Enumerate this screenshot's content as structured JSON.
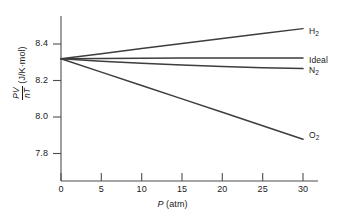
{
  "chart_data": {
    "type": "line",
    "title": "",
    "subtitle": "",
    "xlabel": "P (atm)",
    "xlabel_symbol": "P",
    "xlabel_units": "(atm)",
    "ylabel": "PV/nT (J/K·mol)",
    "ylabel_numerator": "PV",
    "ylabel_denominator": "nT",
    "ylabel_units": "(J/K·mol)",
    "xlim": [
      0,
      30
    ],
    "ylim": [
      7.68,
      8.53
    ],
    "xticks": [
      0,
      5,
      10,
      15,
      20,
      25,
      30
    ],
    "xtick_labels": [
      "0",
      "5",
      "10",
      "15",
      "20",
      "25",
      "30"
    ],
    "yticks": [
      7.8,
      8.0,
      8.2,
      8.4
    ],
    "ytick_labels": [
      "7.8",
      "8.0",
      "8.2",
      "8.4"
    ],
    "grid": false,
    "legend_position": "right-inline-end-of-line",
    "line_color": "#3d3d3d",
    "axis_color": "#4d4d4d",
    "convergence_value": 8.31,
    "series": [
      {
        "name": "H₂",
        "label_main": "H",
        "label_sub": "2",
        "x": [
          0,
          5,
          10,
          15,
          20,
          25,
          30
        ],
        "values": [
          8.31,
          8.336,
          8.362,
          8.388,
          8.414,
          8.44,
          8.465
        ]
      },
      {
        "name": "Ideal",
        "label_main": "Ideal",
        "label_sub": "",
        "x": [
          0,
          5,
          10,
          15,
          20,
          25,
          30
        ],
        "values": [
          8.31,
          8.311,
          8.312,
          8.313,
          8.313,
          8.314,
          8.314
        ]
      },
      {
        "name": "N₂",
        "label_main": "N",
        "label_sub": "2",
        "x": [
          0,
          5,
          10,
          15,
          20,
          25,
          30
        ],
        "values": [
          8.31,
          8.297,
          8.286,
          8.277,
          8.27,
          8.264,
          8.259
        ]
      },
      {
        "name": "O₂",
        "label_main": "O",
        "label_sub": "2",
        "x": [
          0,
          5,
          10,
          15,
          20,
          25,
          30
        ],
        "values": [
          8.31,
          8.241,
          8.172,
          8.103,
          8.034,
          7.965,
          7.895
        ]
      }
    ]
  }
}
